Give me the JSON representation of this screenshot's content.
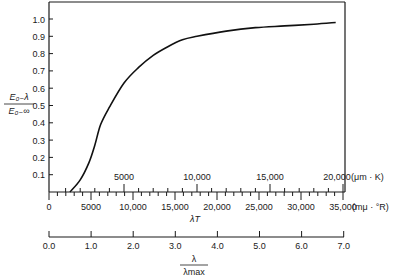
{
  "chart_data": {
    "type": "line",
    "title": "",
    "ylabel": {
      "numerator": "E₀₋λ",
      "denominator": "E₀₋∞"
    },
    "ylim": [
      0,
      1.08
    ],
    "yticks": [
      0.1,
      0.2,
      0.3,
      0.4,
      0.5,
      0.6,
      0.7,
      0.8,
      0.9,
      1.0
    ],
    "ytick_labels": [
      "0.1",
      "0.2",
      "0.3",
      "0.4",
      "0.5",
      "0.6",
      "0.7",
      "0.8",
      "0.9",
      "1.0"
    ],
    "x_axes": [
      {
        "name": "lambdaT_umK",
        "unit_label": "(μm · K)",
        "ticks": [
          5000,
          10000,
          15000,
          20000
        ],
        "tick_labels": [
          "5000",
          "10,000",
          "15,000",
          "20,000"
        ],
        "minor_step": 1000
      },
      {
        "name": "lambdaT_muR",
        "unit_label": "(mμ · °R)",
        "ticks": [
          0,
          5000,
          10000,
          15000,
          20000,
          25000,
          30000,
          35000
        ],
        "tick_labels": [
          "0",
          "5000",
          "10,000",
          "15,000",
          "20,000",
          "25,000",
          "30,000",
          "35,000"
        ],
        "minor_step": 1000,
        "xlabel": "λT"
      },
      {
        "name": "lambda_over_lambdamax",
        "ticks": [
          0.0,
          1.0,
          2.0,
          3.0,
          4.0,
          5.0,
          6.0,
          7.0
        ],
        "tick_labels": [
          "0.0",
          "1.0",
          "2.0",
          "3.0",
          "4.0",
          "5.0",
          "6.0",
          "7.0"
        ],
        "xlabel_numerator": "λ",
        "xlabel_denominator": "λmax"
      }
    ],
    "series": [
      {
        "name": "Fraction of blackbody emission",
        "x_unit": "μm·K",
        "x": [
          1300,
          2000,
          2600,
          3000,
          3400,
          4000,
          5000,
          6000,
          7000,
          8000,
          9000,
          10000,
          12000,
          14000,
          16000,
          18000,
          19500
        ],
        "y": [
          0.0,
          0.07,
          0.17,
          0.27,
          0.39,
          0.49,
          0.63,
          0.72,
          0.79,
          0.84,
          0.88,
          0.9,
          0.93,
          0.95,
          0.96,
          0.97,
          0.98
        ]
      }
    ]
  }
}
